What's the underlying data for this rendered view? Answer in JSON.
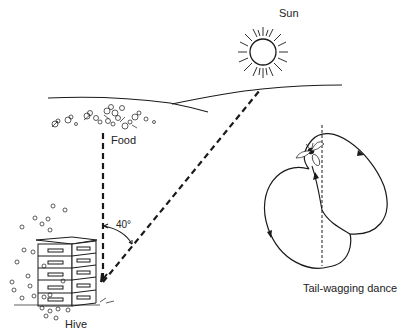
{
  "diagram": {
    "labels": {
      "sun": "Sun",
      "food": "Food",
      "angle": "40°",
      "hive": "Hive",
      "dance": "Tail-wagging dance"
    },
    "nodes": [
      {
        "id": "sun",
        "label": "Sun"
      },
      {
        "id": "food",
        "label": "Food"
      },
      {
        "id": "hive",
        "label": "Hive"
      },
      {
        "id": "dance",
        "label": "Tail-wagging dance"
      }
    ],
    "edges": [
      {
        "from": "hive",
        "to": "food",
        "style": "dashed",
        "direction": "vertical"
      },
      {
        "from": "hive",
        "to": "sun",
        "style": "dashed",
        "direction": "diagonal"
      }
    ],
    "angle_between_food_and_sun_deg": 40,
    "colors": {
      "ink": "#1a1a1a",
      "background": "#ffffff"
    }
  }
}
